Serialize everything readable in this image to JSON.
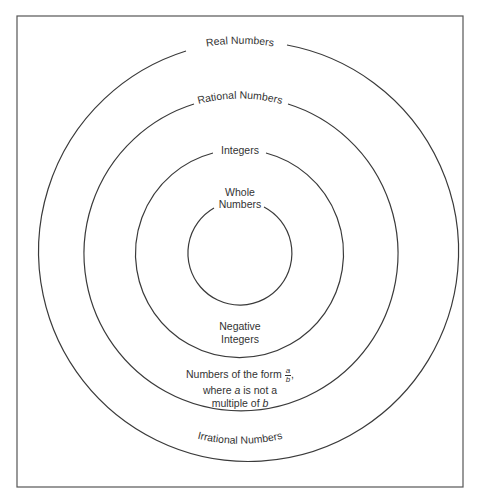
{
  "diagram": {
    "type": "nested-sets",
    "colors": {
      "stroke": "#3a3a3a",
      "text": "#333333",
      "background": "#ffffff",
      "border": "#555555"
    },
    "sets": [
      {
        "id": "real",
        "label": "Real Numbers",
        "level": 1
      },
      {
        "id": "rational",
        "label": "Rational Numbers",
        "level": 2
      },
      {
        "id": "integers",
        "label": "Integers",
        "level": 3
      },
      {
        "id": "whole",
        "label_line1": "Whole",
        "label_line2": "Numbers",
        "level": 4
      }
    ],
    "regions": {
      "negative_integers": {
        "line1": "Negative",
        "line2": "Integers"
      },
      "non_integer_rationals": {
        "line1": "Numbers of the form",
        "frac_num": "a",
        "frac_den": "b",
        "comma": ",",
        "line2_pre": "where ",
        "line2_var": "a",
        "line2_post": " is not a",
        "line3_pre": "multiple of ",
        "line3_var": "b"
      },
      "irrational": {
        "label": "Irrational Numbers"
      }
    }
  }
}
